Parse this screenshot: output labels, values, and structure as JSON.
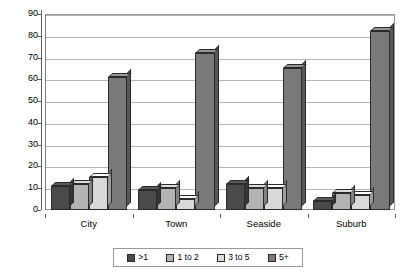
{
  "chart_data": {
    "type": "bar",
    "title": "",
    "subtitle": "",
    "xlabel": "",
    "ylabel": "",
    "ylim": [
      0,
      90
    ],
    "ytick_step": 10,
    "yticks": [
      "90",
      "80",
      "70",
      "60",
      "50",
      "40",
      "30",
      "20",
      "10",
      "0"
    ],
    "grid": true,
    "legend_position": "bottom",
    "style": "3d-column",
    "categories": [
      "City",
      "Town",
      "Seaside",
      "Suburb"
    ],
    "series": [
      {
        "name": ">1",
        "color": "#4a4a4a",
        "values": [
          11,
          9,
          12,
          4
        ]
      },
      {
        "name": "1 to 2",
        "color": "#b4b4b4",
        "values": [
          12,
          10,
          10,
          8
        ]
      },
      {
        "name": "3 to 5",
        "color": "#d9d9d9",
        "values": [
          15,
          5,
          10,
          7
        ]
      },
      {
        "name": "5+",
        "color": "#7a7a7a",
        "values": [
          61,
          72,
          65,
          82
        ]
      }
    ]
  },
  "axes": {
    "plot_background": "#ffffff",
    "gridline_color": "#b5b5b5",
    "axis_color": "#5d5d5d",
    "frame_color": "#9a9a9a"
  },
  "legend": {
    "items": [
      {
        "label": ">1",
        "color": "#4a4a4a"
      },
      {
        "label": "1 to 2",
        "color": "#b4b4b4"
      },
      {
        "label": "3 to 5",
        "color": "#d9d9d9"
      },
      {
        "label": "5+",
        "color": "#7a7a7a"
      }
    ]
  }
}
